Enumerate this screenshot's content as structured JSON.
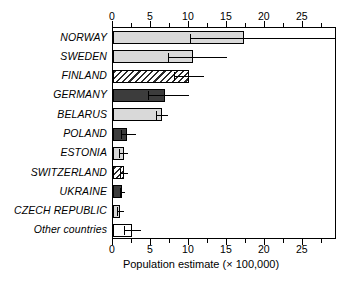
{
  "chart_data": {
    "type": "bar",
    "orientation": "horizontal",
    "title": "",
    "subtitle": "",
    "xlabel": "Population estimate (× 100,000)",
    "ylabel": "",
    "xlim": [
      0,
      29.5
    ],
    "xticks": [
      0,
      5,
      10,
      15,
      20,
      25
    ],
    "xtick_labels": [
      "0",
      "5",
      "10",
      "15",
      "20",
      "25"
    ],
    "minor_tick_step": 2.5,
    "grid": false,
    "legend": "none",
    "axis_top": true,
    "axis_bottom": true,
    "categories": [
      "NORWAY",
      "SWEDEN",
      "FINLAND",
      "GERMANY",
      "BELARUS",
      "POLAND",
      "ESTONIA",
      "SWITZERLAND",
      "UKRAINE",
      "CZECH REPUBLIC",
      "Other countries"
    ],
    "values": [
      17.3,
      10.6,
      10.0,
      6.8,
      6.4,
      1.8,
      1.4,
      1.4,
      1.2,
      0.9,
      2.5
    ],
    "err_low": [
      10.1,
      7.3,
      8.0,
      4.6,
      5.6,
      1.1,
      0.8,
      0.9,
      0.9,
      0.5,
      1.4
    ],
    "err_high": [
      29.5,
      15.0,
      12.0,
      10.0,
      7.3,
      3.0,
      2.0,
      2.0,
      1.6,
      1.5,
      3.7
    ],
    "err_high_clipped": [
      true,
      false,
      false,
      false,
      false,
      false,
      false,
      false,
      false,
      false,
      false
    ],
    "fills": [
      "light",
      "light",
      "hatch",
      "dark",
      "light",
      "dark",
      "light",
      "hatch",
      "dark",
      "light",
      "white"
    ],
    "colors": {
      "light": "#d9d9d9",
      "dark": "#3c3c3c",
      "white": "#ffffff",
      "hatch_stroke": "#2b2b2b",
      "axis": "#000000",
      "text": "#000000"
    }
  }
}
